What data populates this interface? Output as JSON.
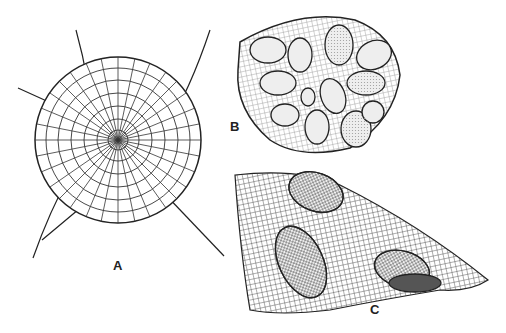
{
  "figure": {
    "panels": [
      {
        "label": "A",
        "description": "Disc-shaped cellular thallus with radiating cell rows and long hairs"
      },
      {
        "label": "B",
        "description": "Rounded triangular cellular disc with embedded stippled oval sporangia"
      },
      {
        "label": "C",
        "description": "Gridded cellular sheet with three raised oval sori, one opened in section"
      }
    ],
    "colors": {
      "ink": "#222222",
      "background": "#ffffff",
      "stipple": "#e6e6e6"
    }
  }
}
